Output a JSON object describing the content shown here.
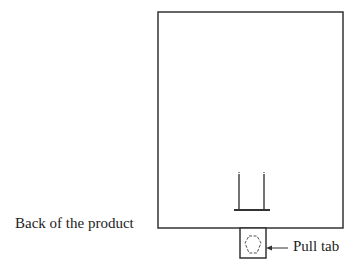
{
  "diagram": {
    "labels": {
      "back_of_product": "Back of the product",
      "pull_tab": "Pull tab"
    },
    "colors": {
      "stroke": "#333333",
      "background": "#ffffff"
    }
  }
}
